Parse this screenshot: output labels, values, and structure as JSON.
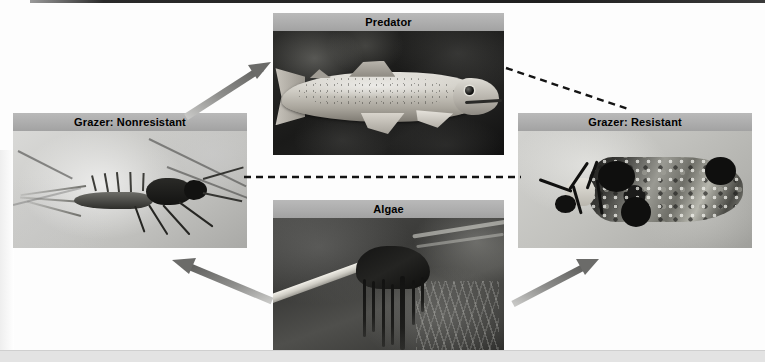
{
  "figure": {
    "background_color": "#fdfdfd"
  },
  "panels": [
    {
      "id": "predator",
      "label": "Predator",
      "photo_description": "Trout facing right over dark rocky streambed",
      "label_bg": "#adadad",
      "label_color": "#000000"
    },
    {
      "id": "grazer-nonresistant",
      "label": "Grazer: Nonresistant",
      "photo_description": "Mayfly nymph on pale background, facing right",
      "label_bg": "#adadad",
      "label_color": "#000000"
    },
    {
      "id": "grazer-resistant",
      "label": "Grazer: Resistant",
      "photo_description": "Caddisfly larva inside gravel case, facing left",
      "label_bg": "#adadad",
      "label_color": "#000000"
    },
    {
      "id": "algae",
      "label": "Algae",
      "photo_description": "Pale stick with dark filamentous algae trailing in stream water",
      "label_bg": "#adadad",
      "label_color": "#000000"
    }
  ],
  "connectors": [
    {
      "id": "nonresistant-to-predator",
      "style": "solid-arrow",
      "color": "#7a7a78",
      "from": "grazer-nonresistant",
      "to": "predator"
    },
    {
      "id": "predator-to-resistant",
      "style": "dashed-line",
      "color": "#1a1a1a",
      "from": "predator",
      "to": "grazer-resistant"
    },
    {
      "id": "nonresistant-to-resistant",
      "style": "dashed-line",
      "color": "#1a1a1a",
      "from": "grazer-nonresistant",
      "to": "grazer-resistant"
    },
    {
      "id": "algae-to-nonresistant",
      "style": "solid-arrow",
      "color": "#7a7a78",
      "from": "algae",
      "to": "grazer-nonresistant"
    },
    {
      "id": "algae-to-resistant",
      "style": "solid-arrow",
      "color": "#7a7a78",
      "from": "algae",
      "to": "grazer-resistant"
    }
  ]
}
